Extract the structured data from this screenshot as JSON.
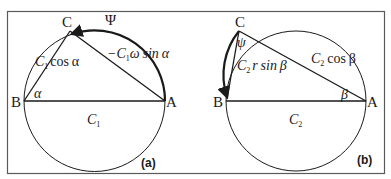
{
  "figure": {
    "frame_color": "#5a5a5a",
    "line_color": "#1a1a1a",
    "panels": [
      {
        "id": "a",
        "label": "(a)",
        "points": {
          "A": "A",
          "B": "B",
          "C": "C"
        },
        "arc_label": "Ψ",
        "angle_label": "α",
        "diameter_label": {
          "main": "C",
          "sub": "1"
        },
        "chord_bc_label": {
          "pre": "C",
          "sub": "1",
          "post": "cos α"
        },
        "chord_ca_label": {
          "pre": "−C",
          "sub": "1",
          "post": "ω sin α"
        }
      },
      {
        "id": "b",
        "label": "(b)",
        "points": {
          "A": "A",
          "B": "B",
          "C": "C"
        },
        "arc_label": "ψ",
        "angle_label": "β",
        "diameter_label": {
          "main": "C",
          "sub": "2"
        },
        "chord_bc_label": {
          "pre": "C",
          "sub": "2",
          "post": "r sin β"
        },
        "chord_ca_label": {
          "pre": "C",
          "sub": "2",
          "post": "cos β"
        }
      }
    ]
  }
}
